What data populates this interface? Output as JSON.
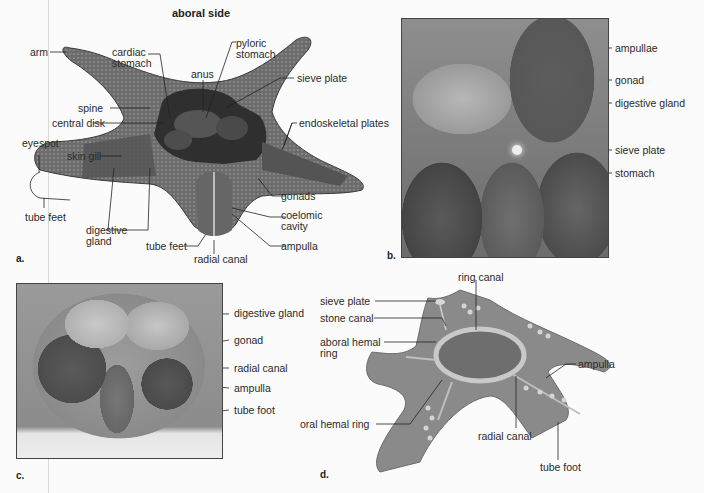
{
  "figure": {
    "panels": [
      {
        "letter": "a.",
        "title": "aboral side",
        "labels": {
          "arm": "arm",
          "cardiac_stomach": "cardiac stomach",
          "pyloric_stomach": "pyloric stomach",
          "anus": "anus",
          "sieve_plate": "sieve plate",
          "spine": "spine",
          "central_disk": "central disk",
          "endoskeletal_plates": "endoskeletal plates",
          "eyespot": "eyespot",
          "skin_gill": "skin gill",
          "tube_feet_left": "tube feet",
          "digestive_gland": "digestive gland",
          "tube_feet_bottom": "tube feet",
          "radial_canal": "radial canal",
          "gonads": "gonads",
          "coelomic_cavity": "coelomic cavity",
          "ampulla": "ampulla"
        }
      },
      {
        "letter": "b.",
        "labels": {
          "ampullae": "ampullae",
          "gonad": "gonad",
          "digestive_gland": "digestive gland",
          "sieve_plate": "sieve plate",
          "stomach": "stomach"
        }
      },
      {
        "letter": "c.",
        "labels": {
          "digestive_gland": "digestive gland",
          "gonad": "gonad",
          "radial_canal": "radial canal",
          "ampulla": "ampulla",
          "tube_foot": "tube foot"
        }
      },
      {
        "letter": "d.",
        "labels": {
          "ring_canal": "ring canal",
          "sieve_plate": "sieve plate",
          "stone_canal": "stone canal",
          "aboral_hemal_ring": "aboral hemal ring",
          "oral_hemal_ring": "oral hemal ring",
          "radial_canal": "radial canal",
          "ampulla": "ampulla",
          "tube_foot": "tube foot"
        }
      }
    ]
  }
}
